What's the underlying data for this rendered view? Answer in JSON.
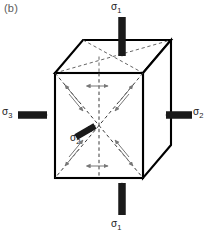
{
  "figure": {
    "panel_label": "(b)",
    "type": "principal-stress-cube-diagram",
    "background_color": "#ffffff",
    "line_color": "#000000",
    "dashed_color": "#3a3a3a",
    "arrow_fill": "#1a1a1a",
    "shear_arrow_color": "#6e6e6e"
  },
  "labels": {
    "sigma1_top": "σ",
    "sigma1_top_sub": "1",
    "sigma1_bottom": "σ",
    "sigma1_bottom_sub": "1",
    "sigma3_left": "σ",
    "sigma3_left_sub": "3",
    "sigma2_right": "σ",
    "sigma2_right_sub": "2",
    "sigma2_center": "σ",
    "sigma2_center_sub": "2"
  },
  "geometry": {
    "front_face": {
      "left": 55,
      "top": 73,
      "right": 143,
      "bottom": 178
    },
    "depth_offset": {
      "dx": 28,
      "dy": -33
    }
  },
  "load_arrows": [
    {
      "name": "sigma1-top-arrow",
      "direction": "down",
      "label": "σ₁"
    },
    {
      "name": "sigma1-bottom-arrow",
      "direction": "up",
      "label": "σ₁"
    },
    {
      "name": "sigma3-left-arrow",
      "direction": "right",
      "label": "σ₃"
    },
    {
      "name": "sigma2-right-arrow",
      "direction": "left",
      "label": "σ₂"
    },
    {
      "name": "sigma2-center-arrow",
      "direction": "up-right",
      "label": "σ₂"
    }
  ],
  "internal_features": {
    "diagonals": "dashed-X-on-front-face",
    "centerline": "vertical-dashed",
    "shear_couples": 4,
    "lateral_double_arrows": 2
  }
}
